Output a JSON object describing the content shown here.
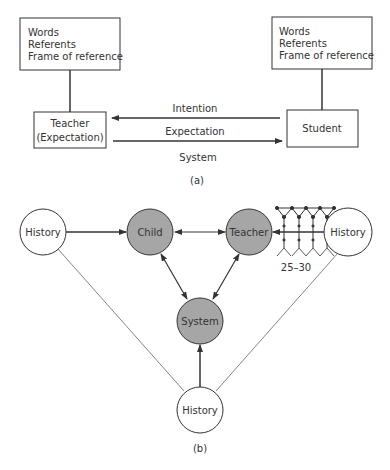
{
  "diagram_a": {
    "caption": "(a)",
    "teacher_frame": {
      "lines": [
        "Words",
        "Referents",
        "Frame of reference"
      ]
    },
    "student_frame": {
      "lines": [
        "Words",
        "Referents",
        "Frame of reference"
      ]
    },
    "teacher_box": {
      "line1": "Teacher",
      "line2": "(Expectation)"
    },
    "student_box": {
      "label": "Student"
    },
    "arrows": {
      "intention": "Intention",
      "expectation": "Expectation"
    },
    "system_label": "System"
  },
  "diagram_b": {
    "caption": "(b)",
    "nodes": {
      "history_left": "History",
      "child": "Child",
      "teacher": "Teacher",
      "history_right": "History",
      "system": "System",
      "history_bottom": "History"
    },
    "class_size_label": "25–30",
    "colors": {
      "shaded_node": "#a6a6a6",
      "open_node": "#ffffff",
      "stroke": "#333333"
    }
  }
}
